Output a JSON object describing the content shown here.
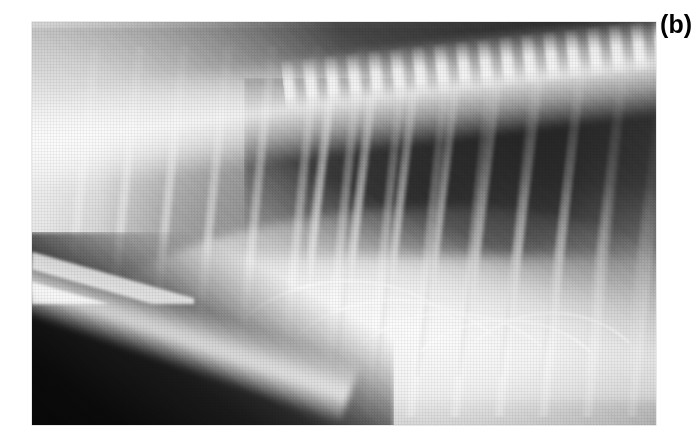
{
  "figure": {
    "panel_label": "(b)",
    "label_position": "top-right",
    "caption": "",
    "modality": "radiograph",
    "view": "lateral thoracic",
    "print_style": "halftone-screened scanned journal figure"
  },
  "image_region": {
    "left_px": 32,
    "top_px": 22,
    "width_px": 624,
    "height_px": 403
  },
  "canvas": {
    "width_px": 698,
    "height_px": 444,
    "background_color": "#ffffff"
  },
  "tones": {
    "background_white": "#ffffff",
    "film_light": "#f4f4f4",
    "film_mid": "#b9b9b9",
    "lung_dark": "#3a3a3a",
    "collimation_black": "#050505",
    "bone_white": "#ffffff",
    "label_color": "#000000"
  },
  "anatomy": [
    {
      "name": "vertebral-column",
      "tone": "bright",
      "location": "dorsal band running cranio-caudally, rising to the right"
    },
    {
      "name": "spinous-processes",
      "tone": "bright-scalloped",
      "location": "along dorsal margin, caudal half"
    },
    {
      "name": "dorsal-soft-tissue",
      "tone": "dark",
      "location": "upper-right band above the spine"
    },
    {
      "name": "caudal-lung-lobe",
      "tone": "dark",
      "location": "large wedge occupying the right two-thirds"
    },
    {
      "name": "cranial-lung-field",
      "tone": "light-gray",
      "location": "left third"
    },
    {
      "name": "ribs",
      "tone": "bright-vertical-bands",
      "location": "arrayed across the thorax, ~11 visible"
    },
    {
      "name": "diaphragm",
      "tone": "bright-curved-border",
      "location": "sweeping from lower-left to caudo-dorsal right"
    },
    {
      "name": "cardiac-silhouette",
      "tone": "mid-gray",
      "location": "central, ventral to the spine"
    },
    {
      "name": "sternum",
      "tone": "bright-band",
      "location": "ventral, lower-left oblique"
    },
    {
      "name": "collimation-edge",
      "tone": "black",
      "location": "lower-left triangular wedge"
    }
  ]
}
